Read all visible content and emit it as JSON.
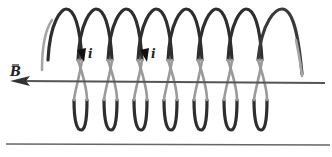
{
  "figure": {
    "labels": {
      "field": "B",
      "current_1": "i",
      "current_2": "i"
    },
    "coil": {
      "turns": 8,
      "front_color": "#9a9a9a",
      "back_color": "#2b2b2b"
    },
    "axis_color": "#555555",
    "baseline_color": "#555555"
  }
}
